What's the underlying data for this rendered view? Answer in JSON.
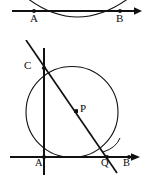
{
  "document": {
    "kind": "geometry-figure-pair",
    "background_color": "#ffffff",
    "ink_color": "#111111",
    "width": 144,
    "height": 175
  },
  "figures": [
    {
      "id": "figure-top",
      "name": "line-AB-with-arc",
      "description": "A horizontal directed line through points A and B, crossed by a downward arc that dips below the line.",
      "labels": [
        {
          "key": "A",
          "text": "A",
          "x": 31,
          "y": 19
        },
        {
          "key": "B",
          "text": "B",
          "x": 117,
          "y": 19
        }
      ],
      "points": [
        {
          "key": "A",
          "text": "A",
          "cx": 34,
          "cy": 11
        },
        {
          "key": "B",
          "text": "B",
          "cx": 120,
          "cy": 11
        }
      ],
      "line": {
        "x1": 12,
        "y1": 11,
        "x2": 140,
        "y2": 11,
        "arrow_end": true
      },
      "arc": {
        "start_x": 27,
        "start_y": 0,
        "end_x": 128,
        "end_y": 0,
        "dip_y": 28
      }
    },
    {
      "id": "figure-bottom",
      "name": "circle-with-chord-CQ-and-point-P",
      "description": "A circle tangent to the horizontal base line at A; a vertical line through A meets the circle at C; a diagonal chord runs from above C down through interior point P to Q on the base line; the base line is directed toward B.",
      "labels": [
        {
          "key": "C",
          "text": "C",
          "x": 25,
          "y": 23
        },
        {
          "key": "P",
          "text": "P",
          "x": 81,
          "y": 69
        },
        {
          "key": "A",
          "text": "A",
          "x": 33,
          "y": 123
        },
        {
          "key": "Q",
          "text": "Q",
          "x": 101,
          "y": 123
        },
        {
          "key": "B",
          "text": "B",
          "x": 124,
          "y": 122
        }
      ],
      "points": [
        {
          "key": "C",
          "text": "C",
          "cx": 44,
          "cy": 28
        },
        {
          "key": "P",
          "text": "P",
          "cx": 76,
          "cy": 71
        },
        {
          "key": "A",
          "text": "A",
          "cx": 44,
          "cy": 117
        },
        {
          "key": "Q",
          "text": "Q",
          "cx": 107,
          "cy": 117
        },
        {
          "key": "B",
          "text": "B",
          "cx": 129,
          "cy": 117
        }
      ],
      "base_line": {
        "x1": 10,
        "y1": 117,
        "x2": 140,
        "y2": 117,
        "arrow_end": true
      },
      "vertical_line": {
        "x": 44,
        "y1": 8,
        "y2": 135
      },
      "diagonal_line": {
        "x1": 26,
        "y1": 0,
        "x2": 117,
        "y2": 133
      },
      "circle": {
        "cx": 72,
        "cy": 72,
        "r": 46
      }
    }
  ]
}
